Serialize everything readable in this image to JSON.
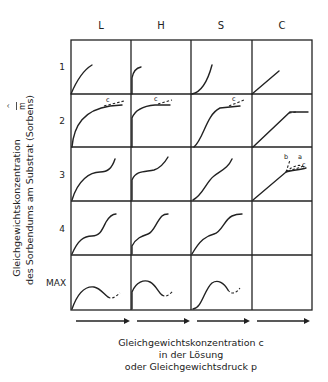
{
  "diagram": {
    "columns": [
      "L",
      "H",
      "S",
      "C"
    ],
    "rows": [
      "1",
      "2",
      "3",
      "4",
      "MAX"
    ],
    "y_axis_label": {
      "line1": "Gleichgewichtskonzentration",
      "symbol": "x̂/m",
      "line2": "des Sorbendums am Substrat (Sorbens)"
    },
    "x_axis_label": {
      "line1": "Gleichgewichtskonzentration c",
      "line2": "in der Lösung",
      "line3": "oder Gleichgewichtsdruck p"
    },
    "annotations": {
      "c": "c",
      "a": "a",
      "b": "b",
      "hat": "^",
      "m": "m"
    }
  }
}
